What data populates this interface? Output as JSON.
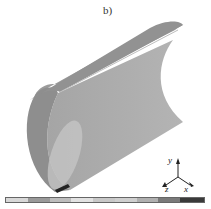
{
  "figure": {
    "panel_label": "b)",
    "axes": {
      "y": "y",
      "z": "z",
      "x": "x"
    }
  },
  "colorbar": {
    "segments": [
      {
        "color": "#d8d8d8",
        "width": 22
      },
      {
        "color": "#9a9a9a",
        "width": 22
      },
      {
        "color": "#bdbdbd",
        "width": 22
      },
      {
        "color": "#e2e2e2",
        "width": 22
      },
      {
        "color": "#c8c8c8",
        "width": 22
      },
      {
        "color": "#cfcfcf",
        "width": 22
      },
      {
        "color": "#b0b0b0",
        "width": 22
      },
      {
        "color": "#7a7a7a",
        "width": 22
      },
      {
        "color": "#3a3a3a",
        "width": 24
      }
    ]
  }
}
